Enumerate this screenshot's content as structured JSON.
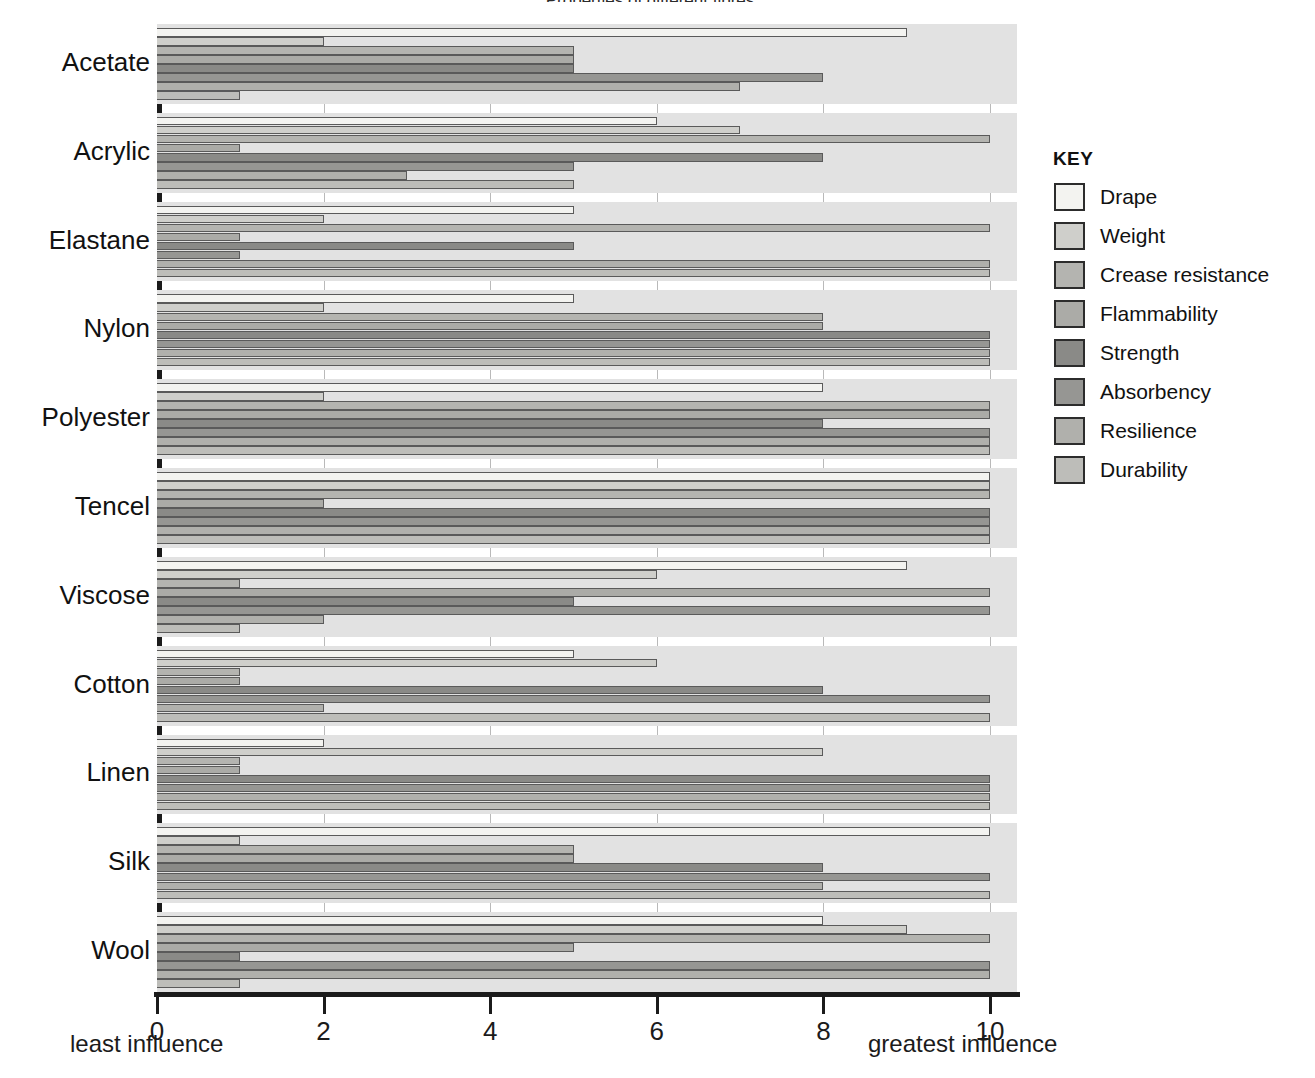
{
  "title": "Properties of different fibres",
  "axis": {
    "ticks": [
      0,
      2,
      4,
      6,
      8,
      10
    ],
    "min": 0,
    "max": 10,
    "left_caption": "least influence",
    "right_caption": "greatest influence"
  },
  "legend": {
    "title": "KEY",
    "items": [
      {
        "label": "Drape",
        "color": "#f3f3f0"
      },
      {
        "label": "Weight",
        "color": "#cfcfcb"
      },
      {
        "label": "Crease resistance",
        "color": "#b4b4b0"
      },
      {
        "label": "Flammability",
        "color": "#ababa7"
      },
      {
        "label": "Strength",
        "color": "#8a8a87"
      },
      {
        "label": "Absorbency",
        "color": "#969693"
      },
      {
        "label": "Resilience",
        "color": "#b0b0ac"
      },
      {
        "label": "Durability",
        "color": "#bdbdb9"
      }
    ]
  },
  "chart_data": {
    "type": "bar",
    "orientation": "horizontal",
    "title": "Properties of different fibres",
    "xlabel": "",
    "ylabel": "",
    "xlim": [
      0,
      10
    ],
    "grid": true,
    "legend_position": "right",
    "categories": [
      "Acetate",
      "Acrylic",
      "Elastane",
      "Nylon",
      "Polyester",
      "Tencel",
      "Viscose",
      "Cotton",
      "Linen",
      "Silk",
      "Wool"
    ],
    "series": [
      {
        "name": "Drape",
        "color": "#f3f3f0",
        "values": [
          9,
          6,
          5,
          5,
          8,
          10,
          9,
          5,
          2,
          10,
          8
        ]
      },
      {
        "name": "Weight",
        "color": "#cfcfcb",
        "values": [
          2,
          7,
          2,
          2,
          2,
          10,
          6,
          6,
          8,
          1,
          9
        ]
      },
      {
        "name": "Crease resistance",
        "color": "#b4b4b0",
        "values": [
          5,
          10,
          10,
          8,
          10,
          10,
          1,
          1,
          1,
          5,
          10
        ]
      },
      {
        "name": "Flammability",
        "color": "#ababa7",
        "values": [
          5,
          1,
          1,
          8,
          10,
          2,
          10,
          1,
          1,
          5,
          5
        ]
      },
      {
        "name": "Strength",
        "color": "#8a8a87",
        "values": [
          5,
          8,
          5,
          10,
          8,
          10,
          5,
          8,
          10,
          8,
          1
        ]
      },
      {
        "name": "Absorbency",
        "color": "#969693",
        "values": [
          8,
          5,
          1,
          10,
          10,
          10,
          10,
          10,
          10,
          10,
          10
        ]
      },
      {
        "name": "Resilience",
        "color": "#b0b0ac",
        "values": [
          7,
          3,
          10,
          10,
          10,
          10,
          2,
          2,
          10,
          8,
          10
        ]
      },
      {
        "name": "Durability",
        "color": "#bdbdb9",
        "values": [
          1,
          5,
          10,
          10,
          10,
          10,
          1,
          10,
          10,
          10,
          1
        ]
      }
    ]
  }
}
